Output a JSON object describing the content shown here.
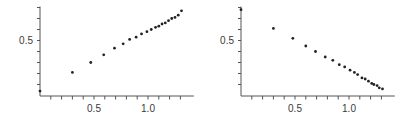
{
  "chart_data": [
    {
      "type": "scatter",
      "title": "",
      "xlabel": "",
      "ylabel": "",
      "xlim": [
        0,
        1.35
      ],
      "ylim": [
        0,
        0.8
      ],
      "grid": false,
      "x_ticks": [
        {
          "value": 0.5,
          "label": "0.5"
        },
        {
          "value": 1.0,
          "label": "1.0"
        }
      ],
      "y_ticks": [
        {
          "value": 0.5,
          "label": "0.5"
        }
      ],
      "x_minor_step": 0.1,
      "y_minor_step": 0.1,
      "series": [
        {
          "name": "increasing",
          "x": [
            0.0,
            0.3,
            0.47,
            0.59,
            0.69,
            0.77,
            0.83,
            0.89,
            0.94,
            0.99,
            1.03,
            1.07,
            1.1,
            1.13,
            1.16,
            1.19,
            1.22,
            1.25,
            1.28,
            1.31
          ],
          "y": [
            0.04,
            0.21,
            0.3,
            0.37,
            0.43,
            0.47,
            0.51,
            0.53,
            0.56,
            0.58,
            0.6,
            0.62,
            0.63,
            0.65,
            0.66,
            0.68,
            0.7,
            0.71,
            0.73,
            0.77
          ]
        }
      ]
    },
    {
      "type": "scatter",
      "title": "",
      "xlabel": "",
      "ylabel": "",
      "xlim": [
        0,
        1.35
      ],
      "ylim": [
        0,
        0.8
      ],
      "grid": false,
      "x_ticks": [
        {
          "value": 0.5,
          "label": "0.5"
        },
        {
          "value": 1.0,
          "label": "1.0"
        }
      ],
      "y_ticks": [
        {
          "value": 0.5,
          "label": "0.5"
        }
      ],
      "x_minor_step": 0.1,
      "y_minor_step": 0.1,
      "series": [
        {
          "name": "decreasing",
          "x": [
            0.0,
            0.3,
            0.48,
            0.6,
            0.69,
            0.78,
            0.85,
            0.91,
            0.96,
            1.01,
            1.05,
            1.08,
            1.12,
            1.15,
            1.18,
            1.21,
            1.23,
            1.26,
            1.28,
            1.31
          ],
          "y": [
            0.78,
            0.61,
            0.52,
            0.45,
            0.4,
            0.35,
            0.32,
            0.28,
            0.26,
            0.23,
            0.21,
            0.19,
            0.16,
            0.15,
            0.13,
            0.11,
            0.1,
            0.09,
            0.07,
            0.06
          ]
        }
      ]
    }
  ],
  "style": {
    "axis_color": "#555555",
    "point_color": "#222222",
    "label_color": "#3a3a3a"
  }
}
